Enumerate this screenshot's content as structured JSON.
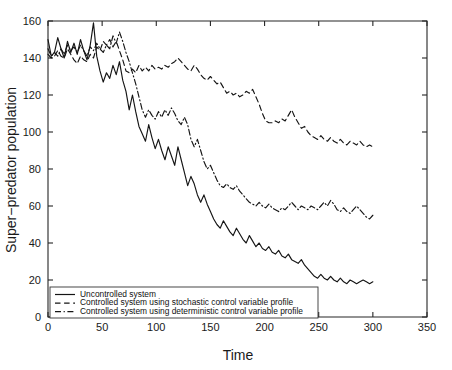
{
  "chart_data": {
    "type": "line",
    "title": "",
    "xlabel": "Time",
    "ylabel": "Super−predator population",
    "xlim": [
      0,
      350
    ],
    "ylim": [
      0,
      160
    ],
    "xticks": [
      0,
      50,
      100,
      150,
      200,
      250,
      300,
      350
    ],
    "yticks": [
      0,
      20,
      40,
      60,
      80,
      100,
      120,
      140,
      160
    ],
    "grid": false,
    "legend_position": "lower-left",
    "series": [
      {
        "name": "Uncontrolled system",
        "style": "solid",
        "color": "#151515",
        "x": [
          0,
          3,
          6,
          9,
          12,
          15,
          18,
          21,
          24,
          27,
          30,
          33,
          36,
          39,
          42,
          45,
          48,
          51,
          54,
          57,
          60,
          63,
          66,
          69,
          72,
          75,
          78,
          81,
          84,
          87,
          90,
          93,
          96,
          99,
          102,
          105,
          108,
          111,
          114,
          117,
          120,
          123,
          126,
          129,
          132,
          135,
          138,
          141,
          144,
          147,
          150,
          153,
          156,
          159,
          162,
          165,
          168,
          171,
          174,
          177,
          180,
          183,
          186,
          189,
          192,
          195,
          198,
          201,
          204,
          207,
          210,
          213,
          216,
          219,
          222,
          225,
          228,
          231,
          234,
          237,
          240,
          243,
          246,
          249,
          252,
          255,
          258,
          261,
          264,
          267,
          270,
          273,
          276,
          279,
          282,
          285,
          288,
          291,
          294,
          297,
          300
        ],
        "y": [
          150,
          141,
          143,
          151,
          145,
          140,
          149,
          143,
          148,
          142,
          150,
          144,
          139,
          147,
          159,
          141,
          133,
          127,
          132,
          129,
          136,
          131,
          138,
          128,
          122,
          112,
          120,
          111,
          103,
          99,
          95,
          104,
          97,
          91,
          96,
          90,
          85,
          92,
          87,
          82,
          92,
          85,
          78,
          71,
          76,
          72,
          66,
          62,
          66,
          61,
          57,
          53,
          50,
          48,
          52,
          49,
          46,
          44,
          48,
          45,
          42,
          40,
          44,
          41,
          38,
          40,
          37,
          36,
          38,
          35,
          34,
          36,
          33,
          32,
          34,
          31,
          30,
          29,
          31,
          28,
          26,
          24,
          22,
          21,
          23,
          21,
          20,
          22,
          20,
          19,
          21,
          19,
          18,
          20,
          19,
          18,
          19,
          20,
          19,
          18,
          19
        ]
      },
      {
        "name": "Controlled system using stochastic control variable profile",
        "style": "dashed",
        "color": "#151515",
        "x": [
          0,
          3,
          6,
          9,
          12,
          15,
          18,
          21,
          24,
          27,
          30,
          33,
          36,
          39,
          42,
          45,
          48,
          51,
          54,
          57,
          60,
          63,
          66,
          69,
          72,
          75,
          78,
          81,
          84,
          87,
          90,
          93,
          96,
          99,
          102,
          105,
          108,
          111,
          114,
          117,
          120,
          123,
          126,
          129,
          132,
          135,
          138,
          141,
          144,
          147,
          150,
          153,
          156,
          159,
          162,
          165,
          168,
          171,
          174,
          177,
          180,
          183,
          186,
          189,
          192,
          195,
          198,
          201,
          204,
          207,
          210,
          213,
          216,
          219,
          222,
          225,
          228,
          231,
          234,
          237,
          240,
          243,
          246,
          249,
          252,
          255,
          258,
          261,
          264,
          267,
          270,
          273,
          276,
          279,
          282,
          285,
          288,
          291,
          294,
          297,
          300
        ],
        "y": [
          142,
          140,
          141,
          144,
          141,
          140,
          145,
          142,
          139,
          137,
          141,
          139,
          138,
          142,
          140,
          146,
          144,
          149,
          147,
          150,
          146,
          149,
          144,
          139,
          133,
          132,
          134,
          132,
          136,
          133,
          135,
          133,
          136,
          134,
          135,
          134,
          136,
          135,
          137,
          138,
          140,
          138,
          136,
          134,
          133,
          136,
          134,
          131,
          129,
          128,
          130,
          128,
          126,
          127,
          124,
          121,
          122,
          120,
          121,
          119,
          120,
          122,
          121,
          123,
          119,
          115,
          110,
          106,
          105,
          105,
          106,
          105,
          107,
          106,
          109,
          112,
          108,
          105,
          102,
          103,
          100,
          98,
          97,
          96,
          98,
          96,
          95,
          97,
          95,
          94,
          96,
          94,
          93,
          95,
          94,
          93,
          95,
          93,
          92,
          93,
          92
        ]
      },
      {
        "name": "Controlled system using deterministic control variable profile",
        "style": "dashdot",
        "color": "#151515",
        "x": [
          0,
          3,
          6,
          9,
          12,
          15,
          18,
          21,
          24,
          27,
          30,
          33,
          36,
          39,
          42,
          45,
          48,
          51,
          54,
          57,
          60,
          63,
          66,
          69,
          72,
          75,
          78,
          81,
          84,
          87,
          90,
          93,
          96,
          99,
          102,
          105,
          108,
          111,
          114,
          117,
          120,
          123,
          126,
          129,
          132,
          135,
          138,
          141,
          144,
          147,
          150,
          153,
          156,
          159,
          162,
          165,
          168,
          171,
          174,
          177,
          180,
          183,
          186,
          189,
          192,
          195,
          198,
          201,
          204,
          207,
          210,
          213,
          216,
          219,
          222,
          225,
          228,
          231,
          234,
          237,
          240,
          243,
          246,
          249,
          252,
          255,
          258,
          261,
          264,
          267,
          270,
          273,
          276,
          279,
          282,
          285,
          288,
          291,
          294,
          297,
          300
        ],
        "y": [
          145,
          141,
          143,
          141,
          145,
          142,
          147,
          144,
          146,
          143,
          147,
          144,
          141,
          146,
          144,
          148,
          145,
          143,
          147,
          145,
          152,
          148,
          154,
          149,
          143,
          138,
          132,
          126,
          119,
          112,
          108,
          112,
          109,
          107,
          111,
          108,
          112,
          109,
          113,
          110,
          106,
          104,
          108,
          104,
          96,
          92,
          96,
          90,
          84,
          80,
          82,
          78,
          74,
          71,
          70,
          72,
          70,
          69,
          71,
          68,
          66,
          64,
          62,
          61,
          60,
          62,
          60,
          59,
          61,
          59,
          58,
          57,
          59,
          58,
          60,
          62,
          60,
          58,
          60,
          59,
          58,
          60,
          59,
          58,
          60,
          62,
          60,
          63,
          61,
          58,
          57,
          59,
          57,
          56,
          58,
          60,
          58,
          56,
          54,
          53,
          55
        ]
      }
    ]
  },
  "legend": {
    "entries": [
      {
        "label": "Uncontrolled system",
        "style": "solid"
      },
      {
        "label": "Controlled system using stochastic control variable profile",
        "style": "dashed"
      },
      {
        "label": "Controlled system using deterministic control variable profile",
        "style": "dashdot"
      }
    ]
  }
}
